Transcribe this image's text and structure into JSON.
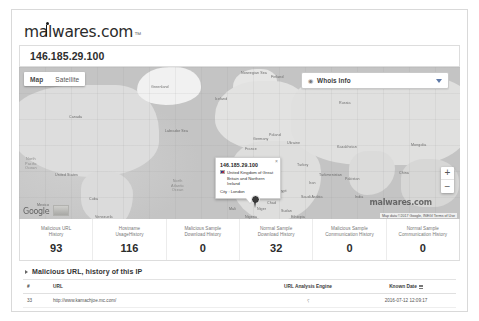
{
  "brand": {
    "name": "malwares.com",
    "trademark": "™"
  },
  "header": {
    "ip": "146.185.29.100"
  },
  "map": {
    "type_buttons": [
      {
        "label": "Map",
        "icon": "map-tile-icon"
      },
      {
        "label": "Satellite",
        "icon": "satellite-icon"
      }
    ],
    "zoom_in": "+",
    "zoom_out": "−",
    "watermark": "malwares.com",
    "attribution": "Map data ©2017 Google, INEGI    Terms of Use",
    "google_logo": "Google",
    "info_bubble": {
      "title": "146.185.29.100",
      "country": "United Kingdom of Great Britain and Northern Ireland",
      "city": "City : London",
      "close": "×"
    },
    "labels": [
      {
        "text": "Greenland",
        "x": 132,
        "y": 18
      },
      {
        "text": "Iceland",
        "x": 196,
        "y": 30
      },
      {
        "text": "Finland",
        "x": 252,
        "y": 8
      },
      {
        "text": "Norwegian Sea",
        "x": 222,
        "y": 4
      },
      {
        "text": "Canada",
        "x": 50,
        "y": 48
      },
      {
        "text": "Labrador Sea",
        "x": 146,
        "y": 62
      },
      {
        "text": "United States",
        "x": 36,
        "y": 106
      },
      {
        "text": "Mexico",
        "x": 18,
        "y": 136
      },
      {
        "text": "Cuba",
        "x": 70,
        "y": 130
      },
      {
        "text": "France",
        "x": 226,
        "y": 80
      },
      {
        "text": "Spain",
        "x": 216,
        "y": 96
      },
      {
        "text": "Italy",
        "x": 244,
        "y": 96
      },
      {
        "text": "Turkey",
        "x": 278,
        "y": 96
      },
      {
        "text": "Ukraine",
        "x": 268,
        "y": 74
      },
      {
        "text": "Poland",
        "x": 250,
        "y": 66
      },
      {
        "text": "Germany",
        "x": 234,
        "y": 70
      },
      {
        "text": "Russia",
        "x": 320,
        "y": 34
      },
      {
        "text": "Kazakhstan",
        "x": 318,
        "y": 78
      },
      {
        "text": "Mongolia",
        "x": 392,
        "y": 76
      },
      {
        "text": "China",
        "x": 380,
        "y": 104
      },
      {
        "text": "Turkmenistan",
        "x": 300,
        "y": 106
      },
      {
        "text": "Iran",
        "x": 290,
        "y": 114
      },
      {
        "text": "Saudi Arabia",
        "x": 282,
        "y": 128
      },
      {
        "text": "India",
        "x": 336,
        "y": 128
      },
      {
        "text": "Egypt",
        "x": 258,
        "y": 122
      },
      {
        "text": "Algeria",
        "x": 216,
        "y": 122
      },
      {
        "text": "Morocco",
        "x": 200,
        "y": 118
      },
      {
        "text": "Mali",
        "x": 210,
        "y": 140
      },
      {
        "text": "Niger",
        "x": 238,
        "y": 140
      },
      {
        "text": "Sudan",
        "x": 262,
        "y": 142
      },
      {
        "text": "Chad",
        "x": 248,
        "y": 134
      },
      {
        "text": "Nigeria",
        "x": 226,
        "y": 148
      },
      {
        "text": "Venezuela",
        "x": 76,
        "y": 148
      },
      {
        "text": "Pakistan",
        "x": 326,
        "y": 110
      },
      {
        "text": "Ethiopia",
        "x": 272,
        "y": 148
      }
    ],
    "ocean_labels": [
      {
        "text": "North\nAtlantic\nOcean",
        "x": 152,
        "y": 112
      },
      {
        "text": "North\nPacific\nOcean",
        "x": 6,
        "y": 90
      }
    ]
  },
  "whois": {
    "selected": "Whois Info",
    "icon": "globe-icon",
    "chevron": "chevron-down-icon"
  },
  "stats": [
    {
      "label": "Malicious URL\nHistory",
      "value": "93"
    },
    {
      "label": "Hostname\nUsageHistory",
      "value": "116"
    },
    {
      "label": "Malicious Sample\nDownload History",
      "value": "0"
    },
    {
      "label": "Normal Sample\nDownload History",
      "value": "32"
    },
    {
      "label": "Malicious Sample\nCommunication History",
      "value": "0"
    },
    {
      "label": "Normal Sample\nCommunication History",
      "value": "0"
    }
  ],
  "section": {
    "title": "Malicious URL, history of this IP",
    "caret": "caret-right-icon"
  },
  "table": {
    "columns": [
      "#",
      "URL",
      "URL Analysis Engine",
      "Known Date"
    ],
    "sort_icon": "sort-icon",
    "rows": [
      {
        "num": "33",
        "url": "http://www.kamachjoe.mc.com/",
        "engine": "⸮",
        "date": "2016-07-12 12:09:17"
      }
    ]
  }
}
